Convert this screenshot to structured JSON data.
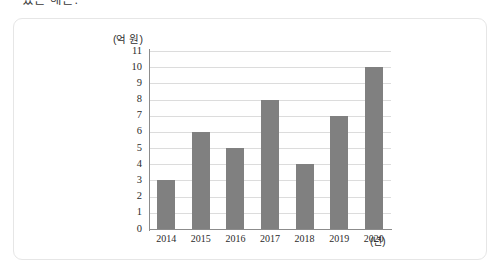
{
  "page": {
    "clipped_text": "있는 해는."
  },
  "chart_data": {
    "type": "bar",
    "title": "",
    "subtitle": "",
    "xlabel": "(년)",
    "ylabel": "(억 원)",
    "categories": [
      "2014",
      "2015",
      "2016",
      "2017",
      "2018",
      "2019",
      "2020"
    ],
    "values": [
      3,
      6,
      5,
      8,
      4,
      7,
      10
    ],
    "series": [
      {
        "name": "",
        "values": [
          3,
          6,
          5,
          8,
          4,
          7,
          10
        ]
      }
    ],
    "ylim": [
      0,
      11
    ],
    "ytick_labels": [
      "11",
      "10",
      "9",
      "8",
      "7",
      "6",
      "5",
      "4",
      "3",
      "2",
      "1",
      "0"
    ],
    "ytick_values": [
      11,
      10,
      9,
      8,
      7,
      6,
      5,
      4,
      3,
      2,
      1,
      0
    ],
    "grid": true,
    "legend": "none",
    "bar_color": "#808080",
    "gridline_color": "#dcdcdc",
    "axis_color": "#8c8c8c"
  }
}
